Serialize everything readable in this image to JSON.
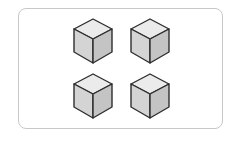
{
  "diagram": {
    "frame": {
      "border_color": "#c8c8c8",
      "background": "#ffffff"
    },
    "cube_style": {
      "top_color": "#ebebeb",
      "left_color": "#d4d4d4",
      "right_color": "#c4c4c4",
      "stroke_color": "#2e2e2e"
    },
    "cubes": [
      {
        "row": 1,
        "col": 1
      },
      {
        "row": 1,
        "col": 2
      },
      {
        "row": 2,
        "col": 1
      },
      {
        "row": 2,
        "col": 2
      }
    ]
  }
}
